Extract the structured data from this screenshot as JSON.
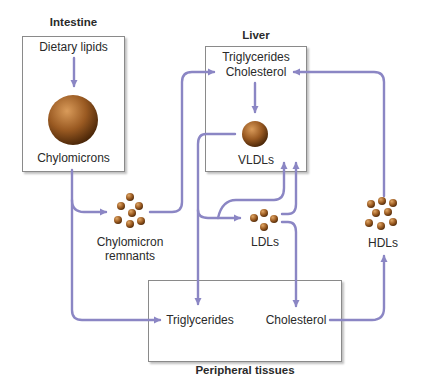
{
  "colors": {
    "arrow": "#8b86c4",
    "particle": "#a8682a",
    "box_border": "#8a8a8a"
  },
  "compartments": {
    "intestine": {
      "title": "Intestine",
      "top_label": "Dietary lipids",
      "bottom_label": "Chylomicrons"
    },
    "liver": {
      "title": "Liver",
      "top_label_line1": "Triglycerides",
      "top_label_line2": "Cholesterol",
      "bottom_label": "VLDLs"
    },
    "peripheral": {
      "title": "Peripheral tissues",
      "left_label": "Triglycerides",
      "right_label": "Cholesterol"
    }
  },
  "particles": {
    "chylomicron_remnants": {
      "line1": "Chylomicron",
      "line2": "remnants"
    },
    "ldls": {
      "label": "LDLs"
    },
    "hdls": {
      "label": "HDLs"
    }
  }
}
